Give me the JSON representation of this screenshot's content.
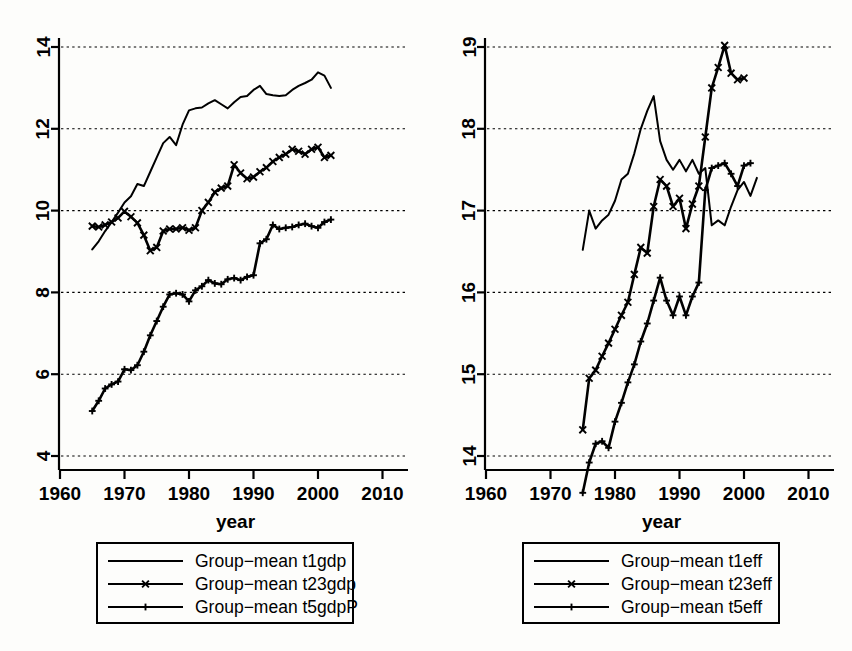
{
  "figure": {
    "background": "#fdfdfb",
    "ink": "#000000",
    "panel_count": 2
  },
  "chart_data": [
    {
      "type": "line",
      "panel": "left",
      "title": "",
      "xlabel": "year",
      "ylabel": "",
      "xlim": [
        1958,
        2012
      ],
      "ylim": [
        3.6,
        14.4
      ],
      "xticks": [
        1960,
        1970,
        1980,
        1990,
        2000,
        2010
      ],
      "xtick_labels": [
        "1960",
        "1970",
        "1980",
        "1990",
        "2000",
        "2010"
      ],
      "yticks": [
        4,
        6,
        8,
        10,
        12,
        14
      ],
      "ytick_labels": [
        "4",
        "6",
        "8",
        "10",
        "12",
        "14"
      ],
      "grid": "horizontal-dotted",
      "legend_position": "below",
      "series": [
        {
          "name": "Group-mean t1gdp",
          "marker": "none",
          "x": [
            1965,
            1966,
            1967,
            1968,
            1969,
            1970,
            1971,
            1972,
            1973,
            1974,
            1975,
            1976,
            1977,
            1978,
            1979,
            1980,
            1981,
            1982,
            1983,
            1984,
            1985,
            1986,
            1987,
            1988,
            1989,
            1990,
            1991,
            1992,
            1993,
            1994,
            1995,
            1996,
            1997,
            1998,
            1999,
            2000,
            2001,
            2002
          ],
          "values": [
            9.05,
            9.25,
            9.5,
            9.72,
            9.95,
            10.2,
            10.35,
            10.65,
            10.6,
            10.95,
            11.3,
            11.65,
            11.8,
            11.6,
            12.1,
            12.45,
            12.5,
            12.52,
            12.62,
            12.7,
            12.6,
            12.5,
            12.65,
            12.78,
            12.8,
            12.95,
            13.05,
            12.85,
            12.82,
            12.8,
            12.82,
            12.95,
            13.05,
            13.12,
            13.2,
            13.38,
            13.3,
            13.0
          ]
        },
        {
          "name": "Group-mean t23gdp",
          "marker": "x",
          "x": [
            1965,
            1966,
            1967,
            1968,
            1969,
            1970,
            1971,
            1972,
            1973,
            1974,
            1975,
            1976,
            1977,
            1978,
            1979,
            1980,
            1981,
            1982,
            1983,
            1984,
            1985,
            1986,
            1987,
            1988,
            1989,
            1990,
            1991,
            1992,
            1993,
            1994,
            1995,
            1996,
            1997,
            1998,
            1999,
            2000,
            2001,
            2002
          ],
          "values": [
            9.62,
            9.6,
            9.65,
            9.72,
            9.82,
            9.98,
            9.85,
            9.7,
            9.4,
            9.02,
            9.1,
            9.5,
            9.55,
            9.55,
            9.58,
            9.52,
            9.58,
            10.0,
            10.2,
            10.45,
            10.55,
            10.6,
            11.12,
            10.92,
            10.78,
            10.82,
            10.95,
            11.05,
            11.2,
            11.3,
            11.38,
            11.5,
            11.45,
            11.38,
            11.5,
            11.55,
            11.3,
            11.35
          ]
        },
        {
          "name": "Group-mean t5gdpP",
          "marker": "plus",
          "x": [
            1965,
            1966,
            1967,
            1968,
            1969,
            1970,
            1971,
            1972,
            1973,
            1974,
            1975,
            1976,
            1977,
            1978,
            1979,
            1980,
            1981,
            1982,
            1983,
            1984,
            1985,
            1986,
            1987,
            1988,
            1989,
            1990,
            1991,
            1992,
            1993,
            1994,
            1995,
            1996,
            1997,
            1998,
            1999,
            2000,
            2001,
            2002
          ],
          "values": [
            5.1,
            5.35,
            5.65,
            5.75,
            5.82,
            6.12,
            6.1,
            6.22,
            6.55,
            6.95,
            7.3,
            7.65,
            7.95,
            7.98,
            7.95,
            7.78,
            8.05,
            8.15,
            8.3,
            8.22,
            8.2,
            8.32,
            8.35,
            8.3,
            8.38,
            8.42,
            9.2,
            9.3,
            9.65,
            9.55,
            9.58,
            9.6,
            9.65,
            9.68,
            9.62,
            9.58,
            9.72,
            9.78
          ]
        }
      ]
    },
    {
      "type": "line",
      "panel": "right",
      "title": "",
      "xlabel": "year",
      "ylabel": "",
      "xlim": [
        1958,
        2012
      ],
      "ylim": [
        13.45,
        19.3
      ],
      "xticks": [
        1960,
        1970,
        1980,
        1990,
        2000,
        2010
      ],
      "xtick_labels": [
        "1960",
        "1970",
        "1980",
        "1990",
        "2000",
        "2010"
      ],
      "yticks": [
        14,
        15,
        16,
        17,
        18,
        19
      ],
      "ytick_labels": [
        "14",
        "15",
        "16",
        "17",
        "18",
        "19"
      ],
      "grid": "horizontal-dotted",
      "legend_position": "below",
      "series": [
        {
          "name": "Group-mean t1eff",
          "marker": "none",
          "x": [
            1975,
            1976,
            1977,
            1978,
            1979,
            1980,
            1981,
            1982,
            1983,
            1984,
            1985,
            1986,
            1987,
            1988,
            1989,
            1990,
            1991,
            1992,
            1993,
            1994,
            1995,
            1996,
            1997,
            1998,
            1999,
            2000,
            2001,
            2002
          ],
          "values": [
            16.52,
            17.0,
            16.78,
            16.88,
            16.95,
            17.12,
            17.38,
            17.45,
            17.7,
            18.0,
            18.22,
            18.4,
            17.85,
            17.62,
            17.5,
            17.62,
            17.48,
            17.62,
            17.45,
            17.52,
            16.82,
            16.88,
            16.82,
            17.05,
            17.25,
            17.35,
            17.18,
            17.4
          ]
        },
        {
          "name": "Group-mean t23eff",
          "marker": "x",
          "x": [
            1975,
            1976,
            1977,
            1978,
            1979,
            1980,
            1981,
            1982,
            1983,
            1984,
            1985,
            1986,
            1987,
            1988,
            1989,
            1990,
            1991,
            1992,
            1993,
            1994,
            1995,
            1996,
            1997,
            1998,
            1999,
            2000
          ],
          "values": [
            14.32,
            14.95,
            15.05,
            15.22,
            15.38,
            15.55,
            15.72,
            15.88,
            16.22,
            16.55,
            16.48,
            17.05,
            17.38,
            17.3,
            17.05,
            17.15,
            16.78,
            17.08,
            17.3,
            17.9,
            18.5,
            18.75,
            19.02,
            18.68,
            18.6,
            18.62
          ]
        },
        {
          "name": "Group-mean t5eff",
          "marker": "plus",
          "x": [
            1975,
            1976,
            1977,
            1978,
            1979,
            1980,
            1981,
            1982,
            1983,
            1984,
            1985,
            1986,
            1987,
            1988,
            1989,
            1990,
            1991,
            1992,
            1993,
            1994,
            1995,
            1996,
            1997,
            1998,
            1999,
            2000,
            2001
          ],
          "values": [
            13.55,
            13.92,
            14.15,
            14.18,
            14.1,
            14.42,
            14.65,
            14.9,
            15.12,
            15.4,
            15.62,
            15.9,
            16.18,
            15.9,
            15.72,
            15.95,
            15.72,
            15.95,
            16.12,
            17.25,
            17.52,
            17.55,
            17.58,
            17.45,
            17.3,
            17.55,
            17.58
          ]
        }
      ]
    }
  ],
  "panels": {
    "left": {
      "x_axis_title": "year",
      "legend": {
        "items": [
          {
            "label": "Group−mean t1gdp",
            "marker": "none"
          },
          {
            "label": "Group−mean t23gdp",
            "marker": "x"
          },
          {
            "label": "Group−mean t5gdpP",
            "marker": "plus"
          }
        ]
      }
    },
    "right": {
      "x_axis_title": "year",
      "legend": {
        "items": [
          {
            "label": "Group−mean t1eff",
            "marker": "none"
          },
          {
            "label": "Group−mean t23eff",
            "marker": "x"
          },
          {
            "label": "Group−mean t5eff",
            "marker": "plus"
          }
        ]
      }
    }
  }
}
